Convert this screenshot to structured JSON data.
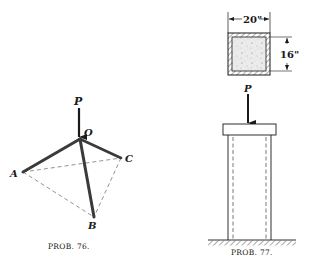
{
  "figures": [
    {
      "id": "prob-76",
      "caption": "PROB. 76.",
      "labels": {
        "load": "P",
        "apex": "O",
        "a": "A",
        "b": "B",
        "c": "C"
      },
      "description": "Tripod of three bars OA, OB, OC meeting at apex O loaded by vertical force P; base triangle ABC shown dashed"
    },
    {
      "id": "prob-77",
      "caption": "PROB. 77.",
      "labels": {
        "load": "P",
        "width": "20\"",
        "height": "16\""
      },
      "description": "Concrete-filled square column (cross-section 20 in by 16 in) with steel shell, loaded by P through a bearing cap, resting on ground"
    }
  ],
  "colors": {
    "ink": "#1a1a1a",
    "bar": "#3a3a3a",
    "dashed": "#777777",
    "fill": "#e6e6e6"
  }
}
